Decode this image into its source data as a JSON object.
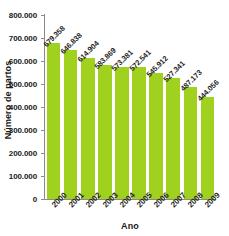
{
  "chart_data": {
    "type": "bar",
    "title": "",
    "xlabel": "Ano",
    "ylabel": "Número de partos",
    "categories": [
      "2000",
      "2001",
      "2002",
      "2003",
      "2004",
      "2005",
      "2006",
      "2007",
      "2008",
      "2009"
    ],
    "values": [
      679358,
      646838,
      614904,
      583869,
      573381,
      572541,
      545912,
      527341,
      487173,
      444056
    ],
    "value_labels": [
      "679.358",
      "646.838",
      "614.904",
      "583.869",
      "573.381",
      "572.541",
      "545.912",
      "527.341",
      "487.173",
      "444.056"
    ],
    "ylim": [
      0,
      800000
    ],
    "ytick_values": [
      0,
      100000,
      200000,
      300000,
      400000,
      500000,
      600000,
      700000,
      800000
    ],
    "ytick_labels": [
      "0",
      "100.000",
      "200.000",
      "300.000",
      "400.000",
      "500.000",
      "600.000",
      "700.000",
      "800.000"
    ],
    "grid": false,
    "legend": null,
    "bar_color": "#9fd11e",
    "axis_color": "#8a8a8a",
    "text_color": "#1f1f1f"
  }
}
